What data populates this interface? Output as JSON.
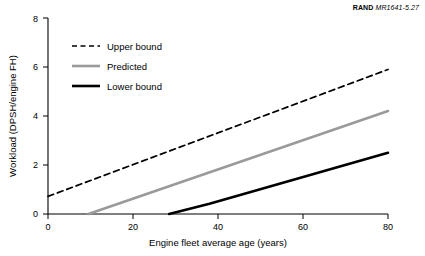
{
  "source_note": {
    "brand": "RAND",
    "doc_id": "MR1641-5.27"
  },
  "chart_data": {
    "type": "line",
    "title": "",
    "xlabel": "Engine fleet average age (years)",
    "ylabel": "Workload (DPSH/engine FH)",
    "xlim": [
      0,
      80
    ],
    "ylim": [
      0,
      8
    ],
    "xticks": [
      0,
      20,
      40,
      60,
      80
    ],
    "yticks": [
      0,
      2,
      4,
      6,
      8
    ],
    "grid": false,
    "legend_position": "top-left",
    "series": [
      {
        "name": "Upper bound",
        "color": "#000000",
        "style": "dashed",
        "points": [
          [
            0,
            0.72
          ],
          [
            80,
            5.9
          ]
        ]
      },
      {
        "name": "Predicted",
        "color": "#9a9a9a",
        "style": "solid",
        "points": [
          [
            9.5,
            0.0
          ],
          [
            80,
            4.2
          ]
        ]
      },
      {
        "name": "Lower bound",
        "color": "#000000",
        "style": "solid",
        "points": [
          [
            28.5,
            0.0
          ],
          [
            38.0,
            0.42
          ],
          [
            80,
            2.5
          ]
        ]
      }
    ],
    "legend": [
      {
        "label": "Upper bound",
        "color": "#000000",
        "style": "dashed"
      },
      {
        "label": "Predicted",
        "color": "#9a9a9a",
        "style": "solid"
      },
      {
        "label": "Lower bound",
        "color": "#000000",
        "style": "solid"
      }
    ]
  }
}
